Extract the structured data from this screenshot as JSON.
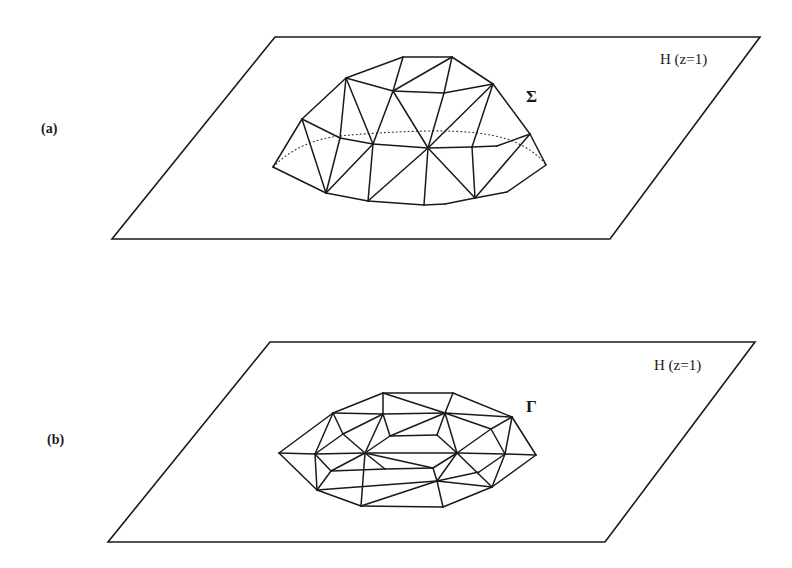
{
  "panels": [
    {
      "id": "a",
      "label": "(a)",
      "plane_label": "H (z=1)",
      "surface_label": "Σ",
      "surface_description": "triangulated dome surface above plane H",
      "plane": [
        [
          275,
          37
        ],
        [
          760,
          37
        ],
        [
          610,
          239
        ],
        [
          112,
          239
        ]
      ],
      "vertices": {
        "t1": [
          403,
          57
        ],
        "t2": [
          452,
          57
        ],
        "u1": [
          346,
          78
        ],
        "u2": [
          393,
          91
        ],
        "u3": [
          444,
          93
        ],
        "u4": [
          493,
          84
        ],
        "m1": [
          302,
          119
        ],
        "m2": [
          340,
          138
        ],
        "m3": [
          373,
          144
        ],
        "m4": [
          428,
          148
        ],
        "m5": [
          472,
          147
        ],
        "m6": [
          497,
          146
        ],
        "m7": [
          530,
          134
        ],
        "e1": [
          273,
          167
        ],
        "e2": [
          546,
          165
        ],
        "b1": [
          326,
          193
        ],
        "b2": [
          368,
          201
        ],
        "b3": [
          424,
          205
        ],
        "b4": [
          445,
          204
        ],
        "b5": [
          475,
          198
        ],
        "b6": [
          507,
          192
        ]
      },
      "edges": [
        [
          "t1",
          "t2"
        ],
        [
          "t1",
          "u1"
        ],
        [
          "t2",
          "u4"
        ],
        [
          "t1",
          "u2"
        ],
        [
          "u2",
          "t2"
        ],
        [
          "t2",
          "u3"
        ],
        [
          "u1",
          "u2"
        ],
        [
          "u2",
          "u3"
        ],
        [
          "u3",
          "u4"
        ],
        [
          "u1",
          "m1"
        ],
        [
          "u4",
          "m7"
        ],
        [
          "u1",
          "m2"
        ],
        [
          "u1",
          "m3"
        ],
        [
          "u2",
          "m3"
        ],
        [
          "u2",
          "m4"
        ],
        [
          "u3",
          "m4"
        ],
        [
          "u4",
          "m4"
        ],
        [
          "u4",
          "m5"
        ],
        [
          "m1",
          "m2"
        ],
        [
          "m2",
          "m3"
        ],
        [
          "m3",
          "m4"
        ],
        [
          "m4",
          "m5"
        ],
        [
          "m5",
          "m6"
        ],
        [
          "m6",
          "m7"
        ],
        [
          "m1",
          "e1"
        ],
        [
          "m7",
          "e2"
        ],
        [
          "m1",
          "b1"
        ],
        [
          "m2",
          "b1"
        ],
        [
          "m3",
          "b1"
        ],
        [
          "m3",
          "b2"
        ],
        [
          "m4",
          "b2"
        ],
        [
          "m4",
          "b3"
        ],
        [
          "m4",
          "b5"
        ],
        [
          "m5",
          "b5"
        ],
        [
          "m7",
          "b5"
        ],
        [
          "e1",
          "b1"
        ],
        [
          "b1",
          "b2"
        ],
        [
          "b2",
          "b3"
        ],
        [
          "b3",
          "b4"
        ],
        [
          "b4",
          "b5"
        ],
        [
          "b5",
          "b6"
        ],
        [
          "b6",
          "e2"
        ]
      ],
      "hidden_curve": "M273,167 Q300,140 340,136 Q380,132 428,131 Q480,130 510,140 Q535,150 546,165"
    },
    {
      "id": "b",
      "label": "(b)",
      "plane_label": "H (z=1)",
      "surface_label": "Γ",
      "surface_description": "flat triangulated region lying in plane H",
      "plane": [
        [
          270,
          342
        ],
        [
          755,
          342
        ],
        [
          605,
          542
        ],
        [
          108,
          542
        ]
      ],
      "vertices": {
        "a1": [
          383,
          393
        ],
        "a2": [
          453,
          393
        ],
        "r1": [
          333,
          413
        ],
        "r2": [
          383,
          414
        ],
        "r3": [
          445,
          413
        ],
        "r4": [
          512,
          417
        ],
        "i1": [
          343,
          434
        ],
        "i2": [
          390,
          436
        ],
        "i3": [
          437,
          435
        ],
        "i4": [
          491,
          429
        ],
        "c0": [
          279,
          453
        ],
        "c1": [
          315,
          454
        ],
        "c2": [
          365,
          453
        ],
        "c3": [
          457,
          453
        ],
        "c4": [
          505,
          454
        ],
        "c5": [
          536,
          455
        ],
        "l1": [
          331,
          471
        ],
        "l2": [
          385,
          469
        ],
        "l3": [
          433,
          468
        ],
        "l4": [
          437,
          481
        ],
        "l5": [
          479,
          472
        ],
        "d1": [
          317,
          490
        ],
        "d2": [
          492,
          487
        ],
        "f1": [
          361,
          506
        ],
        "f2": [
          443,
          507
        ]
      },
      "edges": [
        [
          "a1",
          "a2"
        ],
        [
          "a1",
          "r1"
        ],
        [
          "a1",
          "r2"
        ],
        [
          "a1",
          "r3"
        ],
        [
          "a2",
          "r3"
        ],
        [
          "a2",
          "r4"
        ],
        [
          "r1",
          "r2"
        ],
        [
          "r2",
          "r3"
        ],
        [
          "r3",
          "r4"
        ],
        [
          "r1",
          "c0"
        ],
        [
          "r1",
          "c1"
        ],
        [
          "r1",
          "i1"
        ],
        [
          "r2",
          "i1"
        ],
        [
          "r2",
          "c2"
        ],
        [
          "r2",
          "i2"
        ],
        [
          "i1",
          "c2"
        ],
        [
          "c1",
          "i1"
        ],
        [
          "r3",
          "i2"
        ],
        [
          "r3",
          "i3"
        ],
        [
          "i2",
          "i3"
        ],
        [
          "r3",
          "c3"
        ],
        [
          "i3",
          "c3"
        ],
        [
          "r3",
          "i4"
        ],
        [
          "r4",
          "i4"
        ],
        [
          "r4",
          "c4"
        ],
        [
          "r4",
          "c5"
        ],
        [
          "i4",
          "c3"
        ],
        [
          "i4",
          "c4"
        ],
        [
          "c0",
          "c1"
        ],
        [
          "c1",
          "c2"
        ],
        [
          "c2",
          "c3"
        ],
        [
          "c3",
          "c4"
        ],
        [
          "c4",
          "c5"
        ],
        [
          "c2",
          "i2"
        ],
        [
          "c2",
          "l2"
        ],
        [
          "c2",
          "l3"
        ],
        [
          "c2",
          "l1"
        ],
        [
          "l2",
          "l3"
        ],
        [
          "l3",
          "l4"
        ],
        [
          "c3",
          "l3"
        ],
        [
          "c1",
          "l1"
        ],
        [
          "c1",
          "d1"
        ],
        [
          "l1",
          "d1"
        ],
        [
          "l1",
          "l2"
        ],
        [
          "c2",
          "f1"
        ],
        [
          "c0",
          "d1"
        ],
        [
          "d1",
          "l4"
        ],
        [
          "d1",
          "f1"
        ],
        [
          "f1",
          "f2"
        ],
        [
          "f1",
          "l4"
        ],
        [
          "l4",
          "f2"
        ],
        [
          "c3",
          "l4"
        ],
        [
          "c3",
          "d2"
        ],
        [
          "c4",
          "l5"
        ],
        [
          "l5",
          "l4"
        ],
        [
          "c4",
          "d2"
        ],
        [
          "c5",
          "d2"
        ],
        [
          "l4",
          "d2"
        ],
        [
          "f2",
          "d2"
        ]
      ]
    }
  ],
  "colors": {
    "line": "#1a1a1a",
    "background": "#ffffff"
  }
}
